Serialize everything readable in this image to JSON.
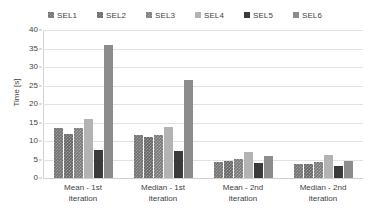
{
  "chart_data": {
    "type": "bar",
    "title": "",
    "xlabel": "",
    "ylabel": "Time [s]",
    "ylim": [
      0,
      40
    ],
    "ytick_step": 5,
    "yticks": [
      40,
      35,
      30,
      25,
      20,
      15,
      10,
      5,
      0
    ],
    "grid": true,
    "legend_position": "top",
    "categories": [
      "Mean - 1st iteration",
      "Median - 1st iteration",
      "Mean - 2nd iteration",
      "Median - 2nd iteration"
    ],
    "category_lines": [
      [
        "Mean - 1st",
        "iteration"
      ],
      [
        "Median - 1st",
        "iteration"
      ],
      [
        "Mean - 2nd",
        "iteration"
      ],
      [
        "Median - 2nd",
        "iteration"
      ]
    ],
    "series": [
      {
        "name": "SEL1",
        "color": "#6e6e6e",
        "values": [
          13.5,
          11.5,
          4.3,
          3.9
        ]
      },
      {
        "name": "SEL2",
        "color": "#656565",
        "values": [
          12.0,
          11.0,
          4.5,
          3.8
        ]
      },
      {
        "name": "SEL3",
        "color": "#787878",
        "values": [
          13.5,
          11.5,
          5.2,
          4.2
        ]
      },
      {
        "name": "SEL4",
        "color": "#b3b3b3",
        "values": [
          16.0,
          13.8,
          7.1,
          6.3
        ]
      },
      {
        "name": "SEL5",
        "color": "#3a3a3a",
        "values": [
          7.5,
          7.3,
          4.0,
          3.3
        ]
      },
      {
        "name": "SEL6",
        "color": "#8c8c8c",
        "values": [
          36.0,
          26.5,
          6.0,
          4.6
        ]
      }
    ]
  }
}
